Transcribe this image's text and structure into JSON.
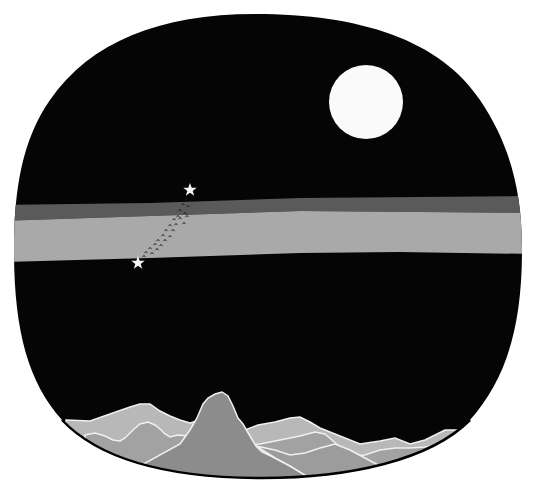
{
  "illustration": {
    "description": "Night sky inside rounded frame with moon, Milky Way band, two stars with a trail of birds, and mountain range",
    "colors": {
      "background": "#ffffff",
      "sky": "#050505",
      "moon": "#fafafa",
      "band_dark": "#5a5a5a",
      "band_light": "#a9a9a9",
      "star": "#f5f5f5",
      "bird": "#1a1a1a",
      "mountain_back": "#b4b4b4",
      "mountain_mid": "#9e9e9e",
      "mountain_front": "#8a8a8a",
      "ridge_line": "#f0f0f0"
    },
    "elements": {
      "moon": "moon",
      "stars": [
        "star-upper",
        "star-lower"
      ],
      "band": "milky-way-band",
      "birds": "bird-flock",
      "mountains": "mountain-range"
    }
  }
}
